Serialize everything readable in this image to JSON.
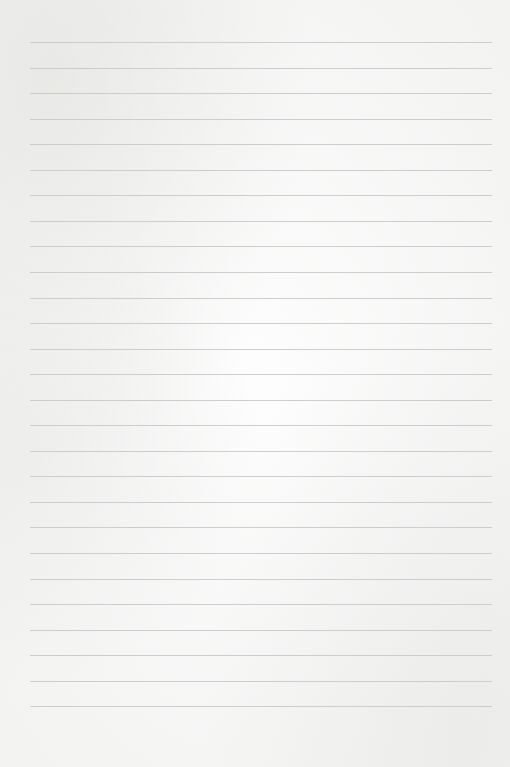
{
  "page": {
    "type": "lined-paper",
    "background_color": "#fdfdfd",
    "line_color": "#c9c9c9",
    "line_count": 27,
    "first_line_y": 42,
    "line_spacing": 25.55,
    "line_left": 30,
    "line_width": 462,
    "text_lines": []
  }
}
